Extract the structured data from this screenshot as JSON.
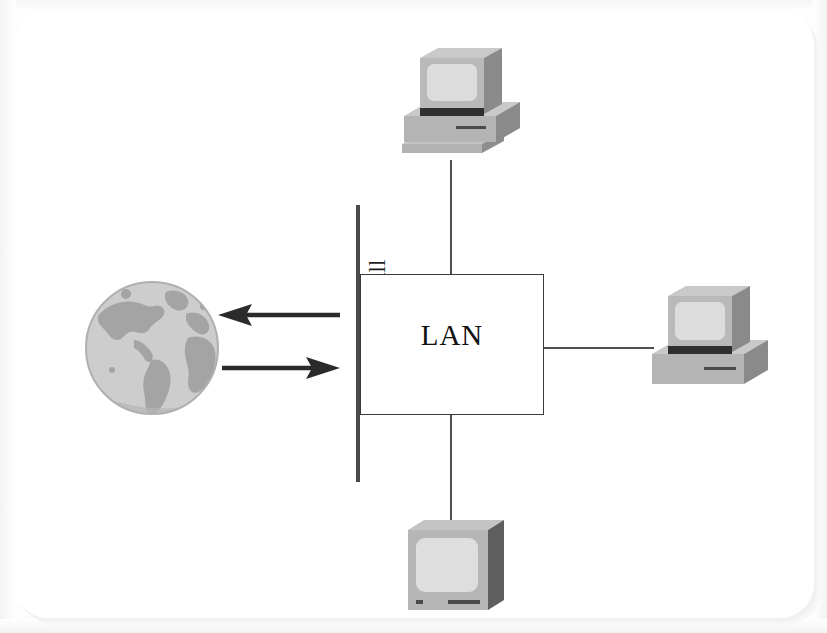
{
  "diagram": {
    "lan": {
      "label": "LAN"
    },
    "firewall": {
      "label": "Firewall"
    },
    "internet": {
      "icon": "globe-icon",
      "label": ""
    },
    "arrows": [
      {
        "name": "outbound-arrow",
        "direction": "left",
        "label": ""
      },
      {
        "name": "inbound-arrow",
        "direction": "right",
        "label": ""
      }
    ],
    "nodes": [
      {
        "name": "workstation-top",
        "icon": "desktop-computer-icon",
        "label": ""
      },
      {
        "name": "workstation-right",
        "icon": "desktop-computer-icon",
        "label": ""
      },
      {
        "name": "workstation-bottom",
        "icon": "monitor-icon",
        "label": ""
      }
    ],
    "colors": {
      "line": "#4f4f4f",
      "box_border": "#3a3a3a",
      "firewall_bar": "#4a4a4a",
      "text": "#121212",
      "globe_ocean": "#cfcfcf",
      "globe_land": "#a6a6a6",
      "device_light": "#c9c9c9",
      "device_mid": "#a8a8a8",
      "device_dark": "#6e6e6e",
      "screen": "#dcdcdc",
      "background": "#ffffff"
    }
  }
}
